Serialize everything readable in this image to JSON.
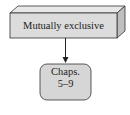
{
  "diagram": {
    "header_box": {
      "label": "Mutually exclusive",
      "style": "3d-box",
      "fill_front": "#dcdcdc",
      "fill_top": "#e8e8e8",
      "fill_side": "#bfbfbf",
      "stroke": "#333333"
    },
    "arrow": {
      "from": "header_box",
      "to": "node_chaps",
      "color": "#222222"
    },
    "node_chaps": {
      "line1": "Chaps.",
      "line2": "5–9",
      "style": "rounded-rect",
      "fill": "#d6d6d6",
      "stroke": "#333333"
    }
  }
}
